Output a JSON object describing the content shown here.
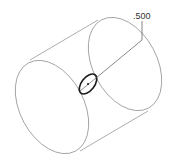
{
  "drawing": {
    "type": "isometric cylinder with hole",
    "dimension_label": ".500",
    "colors": {
      "outline": "#8a8a8a",
      "hole": "#1a1a1a",
      "text": "#333333"
    }
  }
}
